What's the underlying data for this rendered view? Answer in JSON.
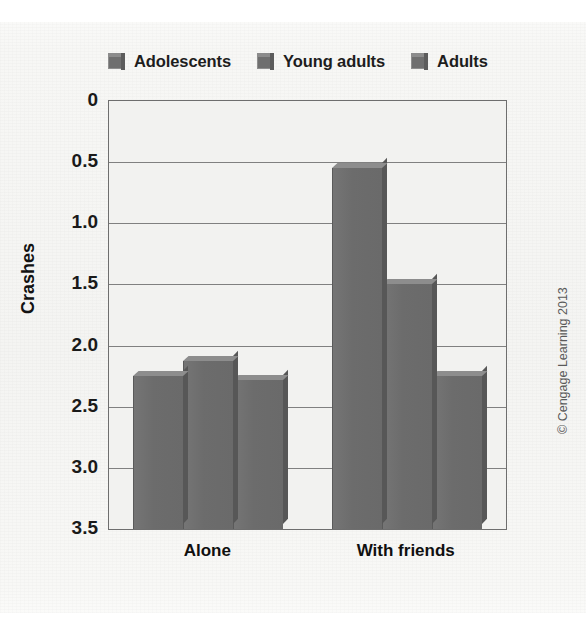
{
  "figure": {
    "credit": "© Cengage Learning 2013"
  },
  "legend": {
    "items": [
      {
        "label": "Adolescents",
        "color": "#6f6f6f"
      },
      {
        "label": "Young adults",
        "color": "#6f6f6f"
      },
      {
        "label": "Adults",
        "color": "#6f6f6f"
      }
    ]
  },
  "axes": {
    "ylabel": "Crashes",
    "yticks": [
      "3.5",
      "3.0",
      "2.5",
      "2.0",
      "1.5",
      "1.0",
      "0.5",
      "0"
    ],
    "xticks": [
      "Alone",
      "With friends"
    ]
  },
  "chart_data": {
    "type": "bar",
    "title": "",
    "xlabel": "",
    "ylabel": "Crashes",
    "ylim": [
      0,
      3.5
    ],
    "ytick_values": [
      0,
      0.5,
      1.0,
      1.5,
      2.0,
      2.5,
      3.0,
      3.5
    ],
    "grid": true,
    "legend_position": "top",
    "categories": [
      "Alone",
      "With friends"
    ],
    "series": [
      {
        "name": "Adolescents",
        "color": "#6f6f6f",
        "values": [
          1.25,
          2.95
        ]
      },
      {
        "name": "Young adults",
        "color": "#6f6f6f",
        "values": [
          1.37,
          2.0
        ]
      },
      {
        "name": "Adults",
        "color": "#6f6f6f",
        "values": [
          1.22,
          1.25
        ]
      }
    ]
  }
}
